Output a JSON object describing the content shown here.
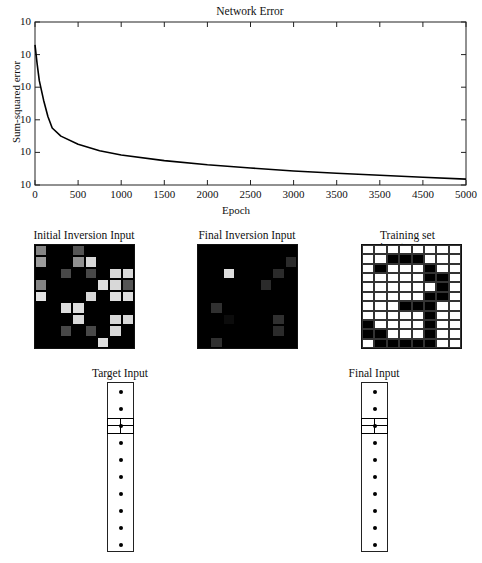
{
  "chart_data": {
    "type": "line",
    "title": "Network Error",
    "xlabel": "Epoch",
    "ylabel": "Sum-squared error",
    "x_ticks": [
      0,
      500,
      1000,
      1500,
      2000,
      2500,
      3000,
      3500,
      4000,
      4500,
      5000
    ],
    "x_tick_labels": [
      "0",
      "500",
      "1000",
      "1500",
      "2000",
      "2500",
      "3000",
      "3500",
      "3500",
      "4500",
      "5000"
    ],
    "y_tick_labels": [
      "10",
      "10",
      "10",
      "10",
      "10",
      "10"
    ],
    "xlim": [
      0,
      5000
    ],
    "ylim_decades": 5,
    "yscale": "log",
    "grid": false,
    "series": [
      {
        "name": "Network Error",
        "x": [
          0,
          25,
          50,
          100,
          150,
          200,
          300,
          500,
          750,
          1000,
          1500,
          2000,
          2500,
          3000,
          3500,
          4000,
          4500,
          5000
        ],
        "y_decades_from_bottom": [
          4.3,
          3.7,
          3.2,
          2.6,
          2.1,
          1.75,
          1.5,
          1.25,
          1.05,
          0.92,
          0.75,
          0.62,
          0.52,
          0.43,
          0.36,
          0.3,
          0.24,
          0.18
        ]
      }
    ]
  },
  "panels": {
    "initial": {
      "title": "Initial Inversion Input",
      "cols": 8,
      "rows": 9,
      "values": [
        [
          0.55,
          0,
          0,
          0.35,
          0,
          0,
          0,
          0
        ],
        [
          0.65,
          0,
          0,
          0.6,
          0.9,
          0,
          0,
          0
        ],
        [
          0,
          0,
          0.3,
          0,
          0.3,
          0,
          0.9,
          0.9
        ],
        [
          0.55,
          0,
          0,
          0,
          0,
          0.92,
          0.9,
          0.35
        ],
        [
          0.95,
          0,
          0,
          0,
          0.9,
          0,
          0.92,
          0.92
        ],
        [
          0,
          0,
          0.92,
          0.92,
          0,
          0,
          0,
          0
        ],
        [
          0,
          0,
          0,
          0.9,
          0,
          0,
          0.9,
          0.9
        ],
        [
          0,
          0,
          0.3,
          0,
          0.3,
          0,
          0.9,
          0
        ],
        [
          0,
          0,
          0,
          0,
          0,
          0.92,
          0,
          0
        ],
        [
          0.95,
          0,
          0,
          0.95,
          0,
          0.55,
          0,
          0,
          0.95
        ]
      ]
    },
    "final": {
      "title": "Final Inversion Input",
      "cols": 8,
      "rows": 9,
      "values": [
        [
          0,
          0,
          0,
          0,
          0,
          0,
          0,
          0
        ],
        [
          0,
          0,
          0,
          0,
          0,
          0,
          0,
          0.18
        ],
        [
          0,
          0,
          0.92,
          0,
          0,
          0,
          0.18,
          0
        ],
        [
          0,
          0,
          0,
          0,
          0,
          0.18,
          0,
          0
        ],
        [
          0,
          0,
          0,
          0,
          0,
          0,
          0,
          0
        ],
        [
          0,
          0.2,
          0,
          0,
          0,
          0,
          0,
          0
        ],
        [
          0,
          0,
          0.05,
          0,
          0,
          0,
          0.2,
          0
        ],
        [
          0,
          0,
          0,
          0,
          0,
          0,
          0.18,
          0
        ],
        [
          0,
          0.2,
          0,
          0,
          0,
          0,
          0,
          0
        ]
      ]
    },
    "training": {
      "title": "Training set input",
      "cols": 8,
      "rows": 11,
      "values": [
        [
          0,
          0,
          0,
          0,
          0,
          0,
          0,
          0
        ],
        [
          0,
          0,
          1,
          1,
          1,
          0,
          0,
          0
        ],
        [
          0,
          1,
          0,
          0,
          0,
          1,
          0,
          0
        ],
        [
          0,
          0,
          0,
          0,
          0,
          1,
          1,
          0
        ],
        [
          0,
          0,
          0,
          0,
          0,
          0,
          1,
          0
        ],
        [
          0,
          0,
          0,
          0,
          0,
          1,
          1,
          0
        ],
        [
          0,
          0,
          0,
          1,
          1,
          1,
          0,
          0
        ],
        [
          0,
          0,
          0,
          0,
          0,
          1,
          0,
          0
        ],
        [
          1,
          0,
          0,
          0,
          0,
          1,
          0,
          0
        ],
        [
          1,
          1,
          0,
          0,
          0,
          1,
          0,
          0
        ],
        [
          0,
          1,
          1,
          1,
          1,
          1,
          0,
          0
        ]
      ]
    },
    "target_vector": {
      "title": "Target Input",
      "dots": 10,
      "highlight_index": 2
    },
    "final_vector": {
      "title": "Final Input",
      "dots": 10,
      "highlight_index": 2
    }
  }
}
